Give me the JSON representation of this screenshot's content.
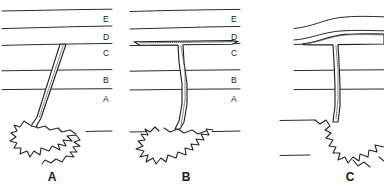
{
  "figure": {
    "background_color": "#ffffff",
    "line_color": "#2b2b2b",
    "stipple_color": "#555555",
    "width": 384,
    "height": 187
  },
  "strata": {
    "labels": [
      "E",
      "D",
      "C",
      "B",
      "A"
    ],
    "label_y": [
      22,
      40,
      55,
      82,
      102
    ],
    "boundary_y": [
      10,
      27,
      44,
      70,
      89,
      131
    ]
  },
  "panels": [
    {
      "id": "panel-a",
      "label": "A",
      "label_x": 52,
      "label_y": 181,
      "x_offset": 0,
      "layer_labels": [
        "E",
        "D",
        "C",
        "B",
        "A"
      ],
      "feature": "dike",
      "feature_description": "Inclined dike rising from magma body and terminating at the base of layer C"
    },
    {
      "id": "panel-b",
      "label": "B",
      "label_x": 186,
      "label_y": 181,
      "x_offset": 128,
      "layer_labels": [
        "E",
        "D",
        "C",
        "B",
        "A"
      ],
      "feature": "sill",
      "feature_description": "Vertical feeder dike with concordant sill spreading along the C/D contact"
    },
    {
      "id": "panel-c",
      "label": "C",
      "label_x": 350,
      "label_y": 181,
      "x_offset": 256,
      "layer_labels": [
        "E",
        "D",
        "C",
        "B",
        "A"
      ],
      "feature": "laccolith",
      "feature_description": "Laccolith inflating along the C/D contact and doming the overlying layers D and E"
    }
  ],
  "pluton": {
    "name": "magma-body",
    "description": "Irregular magma body at depth feeding each intrusion"
  }
}
